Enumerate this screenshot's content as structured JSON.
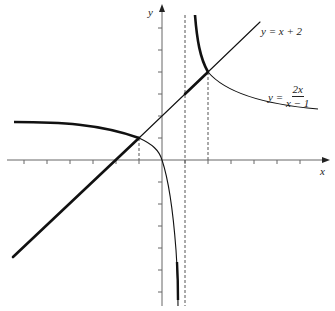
{
  "diagram": {
    "axes": {
      "x_label": "x",
      "y_label": "y",
      "origin_px": [
        162,
        160
      ],
      "x_scale_px_per_unit": 23,
      "y_scale_px_per_unit": 22,
      "x_ticks": [
        -6,
        -5,
        -4,
        -3,
        -2,
        -1,
        1,
        2,
        3,
        4,
        5,
        6
      ],
      "y_ticks": [
        -6,
        -5,
        -4,
        -3,
        -2,
        -1,
        1,
        2,
        3,
        4,
        5,
        6
      ]
    },
    "curves": [
      {
        "name": "line",
        "equation": "y = x + 2",
        "label": "y = x + 2"
      },
      {
        "name": "hyperbola",
        "equation": "y = 2x/(x - 1)",
        "label_lhs": "y =",
        "label_numerator": "2x",
        "label_denominator": "x − 1"
      }
    ],
    "dashed_lines_x": [
      1,
      2
    ],
    "intersections": [
      [
        -1,
        1
      ],
      [
        2,
        4
      ]
    ],
    "asymptotes": {
      "vertical": 1,
      "horizontal": 2
    },
    "colors": {
      "curve": "#111111",
      "axis": "#555555"
    }
  }
}
